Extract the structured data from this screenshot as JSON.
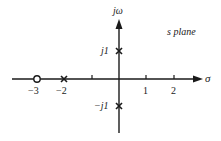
{
  "diagram": {
    "title": "s plane",
    "axes": {
      "real_label": "σ",
      "imag_label": "jω",
      "real_ticks": [
        {
          "value": -3,
          "label": "−3"
        },
        {
          "value": -2,
          "label": "−2"
        },
        {
          "value": -1,
          "label": ""
        },
        {
          "value": 1,
          "label": "1"
        },
        {
          "value": 2,
          "label": "2"
        }
      ],
      "imag_ticks": [
        {
          "value": 1,
          "label": "j1"
        },
        {
          "value": -1,
          "label": "−j1"
        }
      ]
    },
    "poles": [
      {
        "re": -2,
        "im": 0,
        "marker": "x"
      },
      {
        "re": 0,
        "im": 1,
        "marker": "x"
      },
      {
        "re": 0,
        "im": -1,
        "marker": "x"
      }
    ],
    "zeros": [
      {
        "re": -3,
        "im": 0,
        "marker": "o"
      }
    ],
    "colors": {
      "stroke": "#1a1a1a",
      "background": "#ffffff"
    }
  },
  "labels": {
    "s_plane": "s plane",
    "sigma": "σ",
    "jomega": "jω",
    "tick_neg3": "−3",
    "tick_neg2": "−2",
    "tick_1": "1",
    "tick_2": "2",
    "j1": "j1",
    "neg_j1": "−j1"
  }
}
